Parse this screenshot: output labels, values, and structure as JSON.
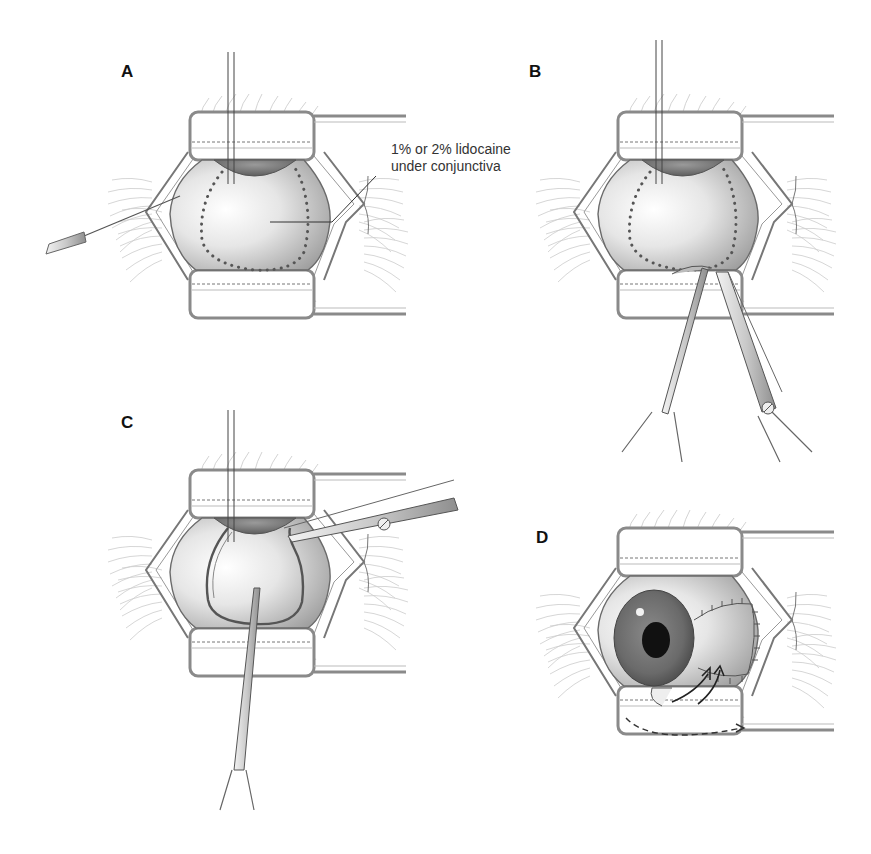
{
  "figure": {
    "panels": [
      {
        "id": "A",
        "label": "A",
        "annotation": {
          "line1": "1% or 2% lidocaine",
          "line2": "under conjunctiva"
        }
      },
      {
        "id": "B",
        "label": "B"
      },
      {
        "id": "C",
        "label": "C"
      },
      {
        "id": "D",
        "label": "D"
      }
    ]
  },
  "colors": {
    "line": "#555555",
    "speculum": "#8a8a8a",
    "globe_light": "#ffffff",
    "globe_dark": "#9a9a9a",
    "iris": "#6e6e6e",
    "pupil": "#111111",
    "text": "#111111"
  }
}
